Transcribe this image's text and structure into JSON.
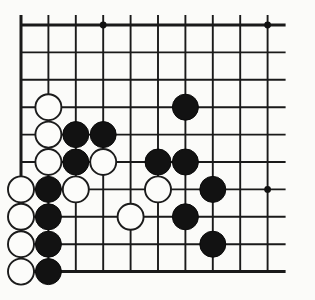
{
  "figure": {
    "kind": "go-board-diagram",
    "background_color": "#fbfbf9",
    "line_color": "#1a1a1a",
    "black_stone_color": "#121212",
    "white_stone_color": "#fcfcfa"
  },
  "board": {
    "visible_columns": 10,
    "visible_rows": 10,
    "origin_x": 21,
    "origin_y": 25,
    "spacing": 27.4,
    "stone_radius": 13.0,
    "edges": {
      "left": true,
      "top": true,
      "bottom": true,
      "right": false
    },
    "star_points": [
      {
        "col": 4,
        "row": 1
      },
      {
        "col": 10,
        "row": 1
      },
      {
        "col": 10,
        "row": 7
      }
    ],
    "stones": [
      {
        "color": "white",
        "col": 2,
        "row": 4
      },
      {
        "color": "white",
        "col": 2,
        "row": 5
      },
      {
        "color": "black",
        "col": 3,
        "row": 5
      },
      {
        "color": "black",
        "col": 4,
        "row": 5
      },
      {
        "color": "black",
        "col": 7,
        "row": 4
      },
      {
        "color": "white",
        "col": 2,
        "row": 6
      },
      {
        "color": "black",
        "col": 3,
        "row": 6
      },
      {
        "color": "white",
        "col": 4,
        "row": 6
      },
      {
        "color": "black",
        "col": 6,
        "row": 6
      },
      {
        "color": "black",
        "col": 7,
        "row": 6
      },
      {
        "color": "white",
        "col": 1,
        "row": 7
      },
      {
        "color": "black",
        "col": 2,
        "row": 7
      },
      {
        "color": "white",
        "col": 3,
        "row": 7
      },
      {
        "color": "white",
        "col": 6,
        "row": 7
      },
      {
        "color": "black",
        "col": 8,
        "row": 7
      },
      {
        "color": "white",
        "col": 1,
        "row": 8
      },
      {
        "color": "black",
        "col": 2,
        "row": 8
      },
      {
        "color": "white",
        "col": 5,
        "row": 8
      },
      {
        "color": "black",
        "col": 7,
        "row": 8
      },
      {
        "color": "white",
        "col": 1,
        "row": 9
      },
      {
        "color": "black",
        "col": 2,
        "row": 9
      },
      {
        "color": "black",
        "col": 8,
        "row": 9
      },
      {
        "color": "white",
        "col": 1,
        "row": 10
      },
      {
        "color": "black",
        "col": 2,
        "row": 10
      }
    ]
  }
}
